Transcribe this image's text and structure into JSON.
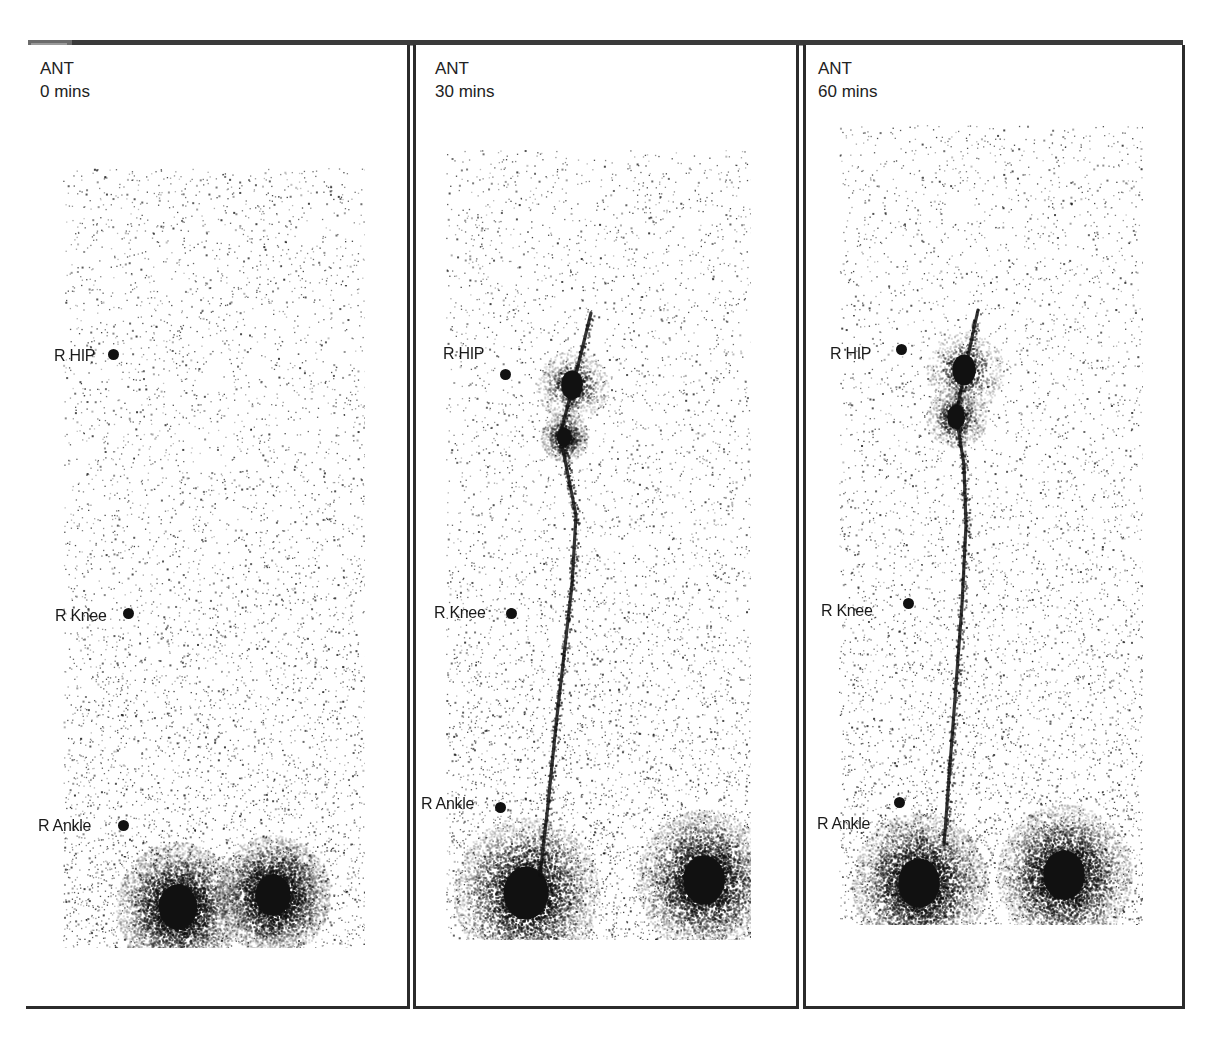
{
  "figure": {
    "view": "ANT",
    "panels": [
      {
        "id": "p1",
        "view_label": "ANT",
        "time_label": "0 mins",
        "scan_box": {
          "left": 37,
          "top": 123,
          "width": 302,
          "height": 780
        },
        "markers": [
          {
            "label": "R HIP",
            "label_pos": [
              28,
              302
            ],
            "dot_pos": [
              82,
              304
            ]
          },
          {
            "label": "R Knee",
            "label_pos": [
              29,
              562
            ],
            "dot_pos": [
              97,
              563
            ]
          },
          {
            "label": "R Ankle",
            "label_pos": [
              12,
              772
            ],
            "dot_pos": [
              92,
              775
            ]
          }
        ],
        "uptake": {
          "feet": [
            {
              "x": 152,
              "y": 862,
              "r": 24
            },
            {
              "x": 247,
              "y": 850,
              "r": 22
            }
          ],
          "channel": []
        }
      },
      {
        "id": "p2",
        "view_label": "ANT",
        "time_label": "30 mins",
        "scan_box": {
          "left": 30,
          "top": 105,
          "width": 305,
          "height": 790
        },
        "markers": [
          {
            "label": "R HIP",
            "label_pos": [
              27,
              300
            ],
            "dot_pos": [
              84,
              324
            ]
          },
          {
            "label": "R Knee",
            "label_pos": [
              18,
              559
            ],
            "dot_pos": [
              90,
              563
            ]
          },
          {
            "label": "R Ankle",
            "label_pos": [
              5,
              750
            ],
            "dot_pos": [
              79,
              757
            ]
          }
        ],
        "uptake": {
          "feet": [
            {
              "x": 110,
              "y": 848,
              "r": 28
            },
            {
              "x": 288,
              "y": 835,
              "r": 26
            }
          ],
          "channel": [
            [
              175,
              268
            ],
            [
              158,
              337
            ],
            [
              144,
              390
            ],
            [
              150,
              420
            ],
            [
              160,
              470
            ],
            [
              156,
              540
            ],
            [
              148,
              610
            ],
            [
              140,
              680
            ],
            [
              132,
              760
            ],
            [
              124,
              830
            ]
          ],
          "nodes": [
            {
              "x": 156,
              "y": 340,
              "r": 12
            },
            {
              "x": 148,
              "y": 392,
              "r": 8
            }
          ]
        }
      },
      {
        "id": "p3",
        "view_label": "ANT",
        "time_label": "60 mins",
        "scan_box": {
          "left": 33,
          "top": 80,
          "width": 304,
          "height": 800
        },
        "markers": [
          {
            "label": "R HIP",
            "label_pos": [
              24,
              300
            ],
            "dot_pos": [
              90,
              299
            ]
          },
          {
            "label": "R Knee",
            "label_pos": [
              15,
              557
            ],
            "dot_pos": [
              97,
              553
            ]
          },
          {
            "label": "R Ankle",
            "label_pos": [
              11,
              770
            ],
            "dot_pos": [
              88,
              752
            ]
          }
        ],
        "uptake": {
          "feet": [
            {
              "x": 113,
              "y": 838,
              "r": 26
            },
            {
              "x": 258,
              "y": 830,
              "r": 26
            }
          ],
          "channel": [
            [
              172,
              265
            ],
            [
              160,
              320
            ],
            [
              150,
              370
            ],
            [
              158,
              420
            ],
            [
              160,
              480
            ],
            [
              156,
              560
            ],
            [
              150,
              640
            ],
            [
              144,
              720
            ],
            [
              138,
              800
            ]
          ],
          "nodes": [
            {
              "x": 158,
              "y": 325,
              "r": 13
            },
            {
              "x": 150,
              "y": 372,
              "r": 10
            }
          ]
        }
      }
    ]
  },
  "colors": {
    "background": "#ffffff",
    "frame": "#2b2b2b",
    "text": "#1a1a1a",
    "uptake": "#111111"
  }
}
